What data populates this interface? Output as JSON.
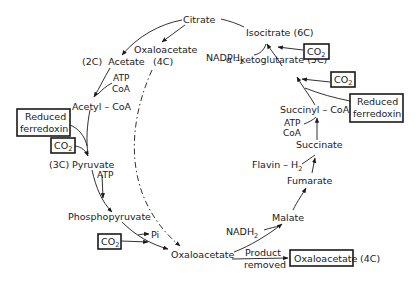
{
  "diagram": {
    "type": "metabolic-cycle",
    "nodes": {
      "citrate": "Citrate",
      "isocitrate": "Isocitrate (6C)",
      "akg": "α –ketoglutarate (5C)",
      "succinyl_coa": "Succinyl – CoA",
      "succinate": "Succinate",
      "fumarate": "Fumarate",
      "malate": "Malate",
      "oxaloacetate_bottom": "Oxaloacetate",
      "phosphopyruvate": "Phosphopyruvate",
      "pyruvate": "(3C) Pyruvate",
      "acetyl_coa": "Acetyl – CoA",
      "acetate": "(2C)  Acetate",
      "oxaloacetate_top": "Oxaloacetate",
      "oxaloacetate_top_c": "(4C)",
      "product_oxaloacetate": "Oxaloacetate",
      "product_c": "(4C)"
    },
    "cofactors": {
      "nadph2": "NADPH",
      "nadph2_sub": "2",
      "atp_coa_left_1": "ATP",
      "atp_coa_left_2": "CoA",
      "atp_coa_right_1": "ATP",
      "atp_coa_right_2": "CoA",
      "flavin": "Flavin – H",
      "flavin_sub": "2",
      "nadh2": "NADH",
      "nadh2_sub": "2",
      "atp_pyruvate": "ATP",
      "pi": "Pi",
      "product_1": "Product",
      "product_2": "removed"
    },
    "boxed_inputs": {
      "co2_label": "CO",
      "co2_sub": "2",
      "reduced_ferredoxin_1": "Reduced",
      "reduced_ferredoxin_2": "ferredoxin"
    }
  }
}
